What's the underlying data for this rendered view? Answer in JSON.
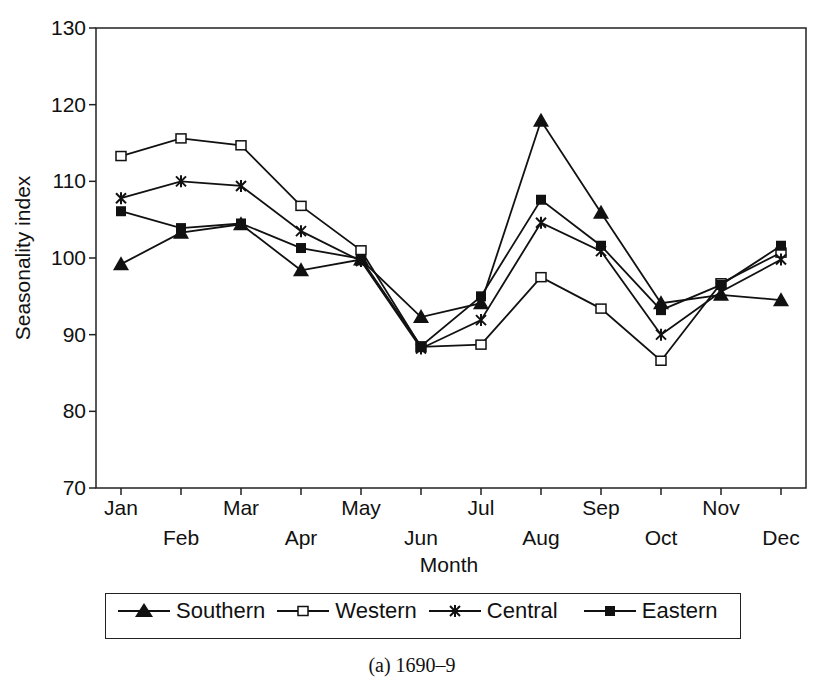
{
  "chart_data": {
    "type": "line",
    "title": "",
    "caption": "(a) 1690–9",
    "xlabel": "Month",
    "ylabel": "Seasonality index",
    "ylim": [
      70,
      130
    ],
    "yticks": [
      70,
      80,
      90,
      100,
      110,
      120,
      130
    ],
    "grid": false,
    "legend_position": "bottom",
    "categories": [
      "Jan",
      "Feb",
      "Mar",
      "Apr",
      "May",
      "Jun",
      "Jul",
      "Aug",
      "Sep",
      "Oct",
      "Nov",
      "Dec"
    ],
    "series": [
      {
        "name": "Southern",
        "marker": "filled-triangle",
        "values": [
          99.2,
          103.3,
          104.4,
          98.4,
          99.8,
          92.3,
          94.1,
          117.9,
          105.9,
          94.1,
          95.2,
          94.5
        ]
      },
      {
        "name": "Western",
        "marker": "open-square",
        "values": [
          113.3,
          115.6,
          114.7,
          106.8,
          101.0,
          88.4,
          88.7,
          97.5,
          93.4,
          86.6,
          96.7,
          100.7
        ]
      },
      {
        "name": "Central",
        "marker": "asterisk",
        "values": [
          107.8,
          110.0,
          109.4,
          103.5,
          99.6,
          88.2,
          91.9,
          104.6,
          100.9,
          90.0,
          95.6,
          99.8
        ]
      },
      {
        "name": "Eastern",
        "marker": "filled-square",
        "values": [
          106.1,
          103.9,
          104.5,
          101.3,
          99.9,
          88.5,
          95.0,
          107.6,
          101.6,
          93.2,
          96.5,
          101.6
        ]
      }
    ]
  },
  "legend": {
    "items": [
      {
        "label": "Southern"
      },
      {
        "label": "Western"
      },
      {
        "label": "Central"
      },
      {
        "label": "Eastern"
      }
    ]
  },
  "caption": "(a) 1690–9"
}
